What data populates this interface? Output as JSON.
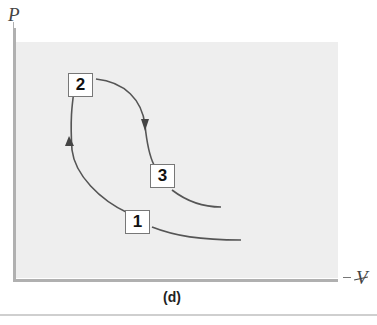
{
  "figure": {
    "caption": "(d)",
    "axes": {
      "y_label": "P",
      "x_label": "V"
    },
    "states": [
      {
        "id": "state-1",
        "label": "1"
      },
      {
        "id": "state-2",
        "label": "2"
      },
      {
        "id": "state-3",
        "label": "3"
      }
    ],
    "process_paths": [
      {
        "from": "1",
        "to": "2",
        "direction": "upward"
      },
      {
        "from": "2",
        "to": "3",
        "direction": "downward"
      }
    ],
    "colors": {
      "plot_background": "#eeeeee",
      "axis": "#b0b0b0",
      "curve": "#555555",
      "box_border": "#777777"
    }
  }
}
